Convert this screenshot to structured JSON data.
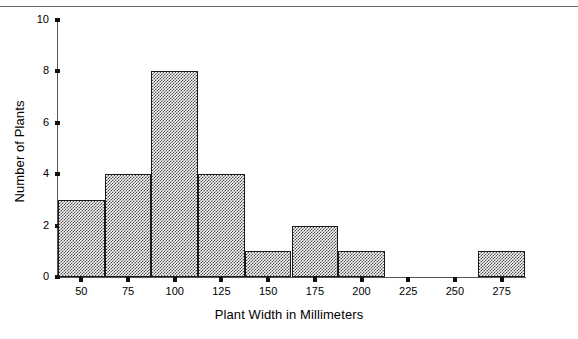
{
  "figure": {
    "top_rule": true
  },
  "chart_data": {
    "type": "bar",
    "title": "",
    "subtitle": "",
    "xlabel": "Plant Width in Millimeters",
    "ylabel": "Number of Plants",
    "xtick_labels": [
      "50",
      "75",
      "100",
      "125",
      "150",
      "175",
      "200",
      "225",
      "250",
      "275"
    ],
    "xtick_values": [
      50,
      75,
      100,
      125,
      150,
      175,
      200,
      225,
      250,
      275
    ],
    "ytick_labels": [
      "0",
      "2",
      "4",
      "6",
      "8",
      "10"
    ],
    "ytick_values": [
      0,
      2,
      4,
      6,
      8,
      10
    ],
    "ylim": [
      0,
      10
    ],
    "xlim": [
      37.5,
      287.5
    ],
    "bin_width": 25,
    "bin_edges": [
      37.5,
      62.5,
      87.5,
      112.5,
      137.5,
      162.5,
      187.5,
      212.5,
      237.5,
      262.5,
      287.5
    ],
    "categories": [
      "37.5-62.5",
      "62.5-87.5",
      "87.5-112.5",
      "112.5-137.5",
      "137.5-162.5",
      "162.5-187.5",
      "187.5-212.5",
      "212.5-237.5",
      "237.5-262.5",
      "262.5-287.5"
    ],
    "values": [
      3,
      4,
      8,
      4,
      1,
      2,
      1,
      0,
      0,
      1
    ],
    "total_count": 24,
    "grid": false,
    "legend": false,
    "bar_fill": "#4a4a4a",
    "bar_fill_style": "checkerboard-dither-50",
    "bar_edge_color": "#1a1a1a",
    "axis_color": "#555555",
    "background": "#ffffff"
  }
}
